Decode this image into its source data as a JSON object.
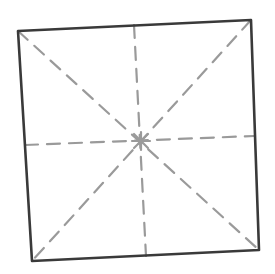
{
  "diagram": {
    "type": "fold-pattern-sketch",
    "canvas": {
      "width": 275,
      "height": 274,
      "background": "#ffffff"
    },
    "square": {
      "corners": {
        "top_left": [
          18,
          31
        ],
        "top_right": [
          251,
          20
        ],
        "bottom_right": [
          259,
          250
        ],
        "bottom_left": [
          32,
          261
        ]
      },
      "stroke_color": "#3a3a3a",
      "stroke_width": 2.6
    },
    "fold_lines": {
      "stroke_color": "#9a9a9a",
      "stroke_width": 2.2,
      "dash_pattern": "13 9",
      "center": [
        141,
        141
      ],
      "lines": [
        {
          "name": "diagonal-tl-br",
          "from": [
            18,
            31
          ],
          "to": [
            259,
            250
          ]
        },
        {
          "name": "diagonal-tr-bl",
          "from": [
            251,
            20
          ],
          "to": [
            32,
            261
          ]
        },
        {
          "name": "vertical-midline",
          "from": [
            134,
            25
          ],
          "to": [
            146,
            256
          ]
        },
        {
          "name": "horizontal-midline",
          "from": [
            25,
            145
          ],
          "to": [
            254,
            136
          ]
        }
      ]
    }
  }
}
